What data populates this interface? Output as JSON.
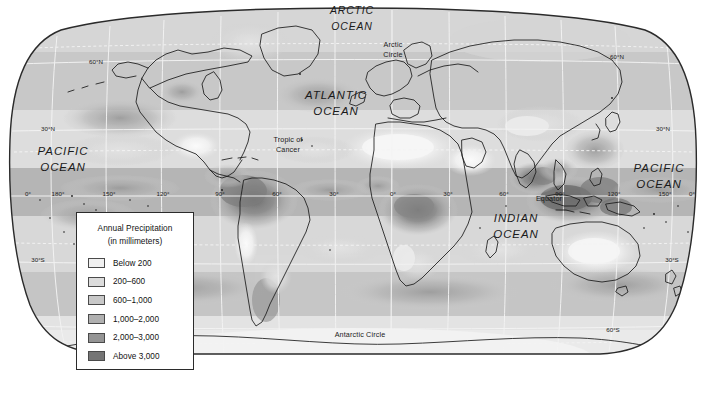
{
  "map": {
    "projection_outline": "elliptical-robinson",
    "background_color": "#ffffff",
    "border_color": "#2b2b2b",
    "graticule_color": "#f2f2f2",
    "coastline_color": "#1a1a1a",
    "ocean_labels": [
      {
        "name": "arctic-ocean",
        "line1": "ARCTIC",
        "line2": "OCEAN",
        "x": 352,
        "y": 14,
        "x2": 352,
        "y2": 30
      },
      {
        "name": "atlantic-ocean",
        "line1": "ATLANTIC",
        "line2": "OCEAN",
        "x": 336,
        "y": 99,
        "x2": 336,
        "y2": 115
      },
      {
        "name": "pacific-ocean-west",
        "line1": "PACIFIC",
        "line2": "OCEAN",
        "x": 63,
        "y": 155,
        "x2": 63,
        "y2": 171
      },
      {
        "name": "pacific-ocean-east",
        "line1": "PACIFIC",
        "line2": "OCEAN",
        "x": 659,
        "y": 172,
        "x2": 659,
        "y2": 188
      },
      {
        "name": "indian-ocean",
        "line1": "INDIAN",
        "line2": "OCEAN",
        "x": 516,
        "y": 222,
        "x2": 516,
        "y2": 238
      }
    ],
    "feature_labels": [
      {
        "name": "arctic-circle",
        "line1": "Arctic",
        "line2": "Circle",
        "x": 393,
        "y": 47,
        "x2": 393,
        "y2": 57
      },
      {
        "name": "tropic-of-cancer",
        "line1": "Tropic of",
        "line2": "Cancer",
        "x": 288,
        "y": 142,
        "x2": 288,
        "y2": 152
      },
      {
        "name": "equator",
        "line1": "Equator",
        "x": 549,
        "y": 201
      },
      {
        "name": "antarctic-circle",
        "line1": "Antarctic Circle",
        "x": 360,
        "y": 337
      }
    ],
    "latitude_labels": [
      {
        "name": "lat-60n-left",
        "text": "60°N",
        "x": 96,
        "y": 64
      },
      {
        "name": "lat-60n-right",
        "text": "60°N",
        "x": 617,
        "y": 59
      },
      {
        "name": "lat-30n-left",
        "text": "30°N",
        "x": 48,
        "y": 131
      },
      {
        "name": "lat-30n-right",
        "text": "30°N",
        "x": 663,
        "y": 131
      },
      {
        "name": "lat-30s-left",
        "text": "30°S",
        "x": 38,
        "y": 262
      },
      {
        "name": "lat-30s-right",
        "text": "30°S",
        "x": 672,
        "y": 262
      },
      {
        "name": "lat-60s-right",
        "text": "60°S",
        "x": 613,
        "y": 332
      }
    ],
    "longitude_labels": [
      {
        "name": "lon-0-left",
        "text": "0°",
        "x": 28,
        "y": 196
      },
      {
        "name": "lon-180-west",
        "text": "180°",
        "x": 58,
        "y": 196
      },
      {
        "name": "lon-150-west",
        "text": "150°",
        "x": 109,
        "y": 196
      },
      {
        "name": "lon-120-west",
        "text": "120°",
        "x": 163,
        "y": 196
      },
      {
        "name": "lon-90-west",
        "text": "90°",
        "x": 220,
        "y": 196
      },
      {
        "name": "lon-60-west",
        "text": "60°",
        "x": 277,
        "y": 196
      },
      {
        "name": "lon-30-west",
        "text": "30°",
        "x": 334,
        "y": 196
      },
      {
        "name": "lon-0-prime",
        "text": "0°",
        "x": 393,
        "y": 196
      },
      {
        "name": "lon-30-east",
        "text": "30°",
        "x": 448,
        "y": 196
      },
      {
        "name": "lon-60-east",
        "text": "60°",
        "x": 504,
        "y": 196
      },
      {
        "name": "lon-90-east",
        "text": "90°",
        "x": 560,
        "y": 196
      },
      {
        "name": "lon-120-east",
        "text": "120°",
        "x": 614,
        "y": 196
      },
      {
        "name": "lon-150-east",
        "text": "150°",
        "x": 665,
        "y": 196
      },
      {
        "name": "lon-180-east",
        "text": "0°",
        "x": 692,
        "y": 196
      }
    ]
  },
  "legend": {
    "title_line1": "Annual Precipitation",
    "title_line2": "(in millimeters)",
    "items": [
      {
        "label": "Below 200",
        "color": "#f0f0f0"
      },
      {
        "label": "200–600",
        "color": "#dcdcdc"
      },
      {
        "label": "600–1,000",
        "color": "#c8c8c8"
      },
      {
        "label": "1,000–2,000",
        "color": "#b0b0b0"
      },
      {
        "label": "2,000–3,000",
        "color": "#949494"
      },
      {
        "label": "Above 3,000",
        "color": "#757575"
      }
    ]
  },
  "chart_data": {
    "type": "map",
    "title": "Annual Precipitation (in millimeters)",
    "classes": [
      "Below 200",
      "200–600",
      "600–1,000",
      "1,000–2,000",
      "2,000–3,000",
      "Above 3,000"
    ],
    "class_colors": [
      "#f0f0f0",
      "#dcdcdc",
      "#c8c8c8",
      "#b0b0b0",
      "#949494",
      "#757575"
    ],
    "legend_position": "lower-left",
    "grid": true,
    "graticule_interval_deg": 30,
    "regions_noted": [
      {
        "region": "Amazon Basin",
        "class": "Above 3,000"
      },
      {
        "region": "Congo Basin",
        "class": "2,000–3,000"
      },
      {
        "region": "Indonesia / Maritime Southeast Asia",
        "class": "Above 3,000"
      },
      {
        "region": "Sahara Desert",
        "class": "Below 200"
      },
      {
        "region": "Arabian Peninsula",
        "class": "Below 200"
      },
      {
        "region": "Central Australia",
        "class": "Below 200"
      },
      {
        "region": "Antarctica",
        "class": "Below 200"
      }
    ]
  }
}
